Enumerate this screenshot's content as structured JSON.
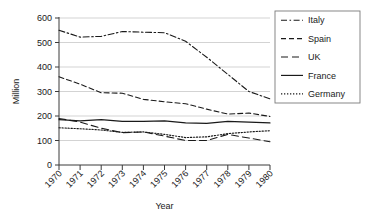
{
  "chart_data": {
    "type": "line",
    "title": "",
    "xlabel": "Year",
    "ylabel": "Million",
    "x": [
      1970,
      1971,
      1972,
      1973,
      1974,
      1975,
      1976,
      1977,
      1978,
      1979,
      1980
    ],
    "categories": [
      "1970",
      "1971",
      "1972",
      "1973",
      "1974",
      "1975",
      "1976",
      "1977",
      "1978",
      "1979",
      "1980"
    ],
    "xlim": [
      1970,
      1980
    ],
    "ylim": [
      0,
      600
    ],
    "yticks": [
      0,
      100,
      200,
      300,
      400,
      500,
      600
    ],
    "ytick_labels": [
      "0",
      "100",
      "200",
      "300",
      "400",
      "500",
      "600"
    ],
    "grid": "horizontal",
    "legend_position": "right-outside",
    "series": [
      {
        "name": "Italy",
        "dash_style": "dash-dot",
        "values": [
          550,
          522,
          525,
          545,
          542,
          540,
          505,
          440,
          370,
          300,
          270
        ]
      },
      {
        "name": "Spain",
        "dash_style": "dashed",
        "values": [
          360,
          330,
          295,
          293,
          268,
          258,
          250,
          228,
          208,
          212,
          198
        ]
      },
      {
        "name": "UK",
        "dash_style": "long-dash",
        "values": [
          190,
          175,
          150,
          132,
          135,
          118,
          100,
          100,
          125,
          110,
          95
        ]
      },
      {
        "name": "France",
        "dash_style": "solid",
        "values": [
          185,
          180,
          185,
          178,
          178,
          180,
          172,
          170,
          178,
          175,
          172
        ]
      },
      {
        "name": "Germany",
        "dash_style": "dotted",
        "values": [
          152,
          148,
          143,
          133,
          135,
          125,
          112,
          115,
          128,
          135,
          140
        ]
      }
    ]
  },
  "legend": {
    "entries": [
      {
        "label": "Italy"
      },
      {
        "label": "Spain"
      },
      {
        "label": "UK"
      },
      {
        "label": "France"
      },
      {
        "label": "Germany"
      }
    ]
  },
  "axes": {
    "y_title": "Million",
    "x_title": "Year",
    "y_tick_labels": [
      "600",
      "500",
      "400",
      "300",
      "200",
      "100",
      "0"
    ],
    "x_tick_labels": [
      "1970",
      "1971",
      "1972",
      "1973",
      "1974",
      "1975",
      "1976",
      "1977",
      "1978",
      "1979",
      "1980"
    ]
  },
  "colors": {
    "line": "#1a1a1a",
    "grid": "#c8c8c8",
    "axis": "#3a3a3a",
    "legend_border": "#7a7a7a",
    "background": "#ffffff"
  }
}
